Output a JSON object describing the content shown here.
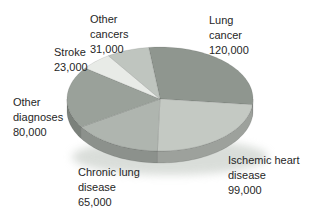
{
  "chart_data": {
    "type": "pie",
    "style": "3d",
    "title": "",
    "total": 418000,
    "start_angle_deg": -97,
    "direction": "clockwise",
    "geometry": {
      "cx": 160,
      "cy": 99,
      "rx": 93,
      "ry": 52,
      "depth": 12
    },
    "slices": [
      {
        "id": "lung-cancer",
        "label": "Lung cancer",
        "value": 120000,
        "value_display": "120,000",
        "label_display": "Lung\ncancer\n120,000",
        "color": "#8f968f"
      },
      {
        "id": "ischemic",
        "label": "Ischemic heart disease",
        "value": 99000,
        "value_display": "99,000",
        "label_display": "Ischemic heart\ndisease\n99,000",
        "color": "#c4c9c3"
      },
      {
        "id": "chronic",
        "label": "Chronic lung disease",
        "value": 65000,
        "value_display": "65,000",
        "label_display": "Chronic lung\ndisease\n65,000",
        "color": "#afb5af"
      },
      {
        "id": "other-diagnoses",
        "label": "Other diagnoses",
        "value": 80000,
        "value_display": "80,000",
        "label_display": "Other\ndiagnoses\n80,000",
        "color": "#9aa19a"
      },
      {
        "id": "stroke",
        "label": "Stroke",
        "value": 23000,
        "value_display": "23,000",
        "label_display": "Stroke\n23,000",
        "color": "#e8ebe7"
      },
      {
        "id": "other-cancers",
        "label": "Other cancers",
        "value": 31000,
        "value_display": "31,000",
        "label_display": "Other\ncancers\n31,000",
        "color": "#bfc5bf"
      }
    ]
  }
}
